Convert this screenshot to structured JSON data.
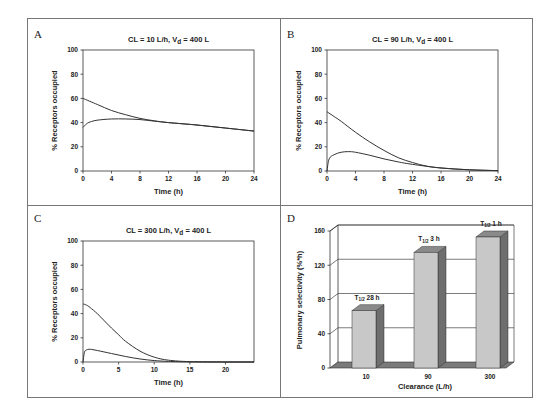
{
  "figure": {
    "panels": [
      "A",
      "B",
      "C",
      "D"
    ]
  },
  "chart_data": [
    {
      "panel": "A",
      "type": "line",
      "title": "CL = 10 L/h, Vd = 400 L",
      "title_parts": {
        "pre": "CL = 10 L/h, V",
        "sub": "d",
        "post": " = 400 L"
      },
      "xlabel": "Time (h)",
      "ylabel": "% Receptors occupied",
      "xlim": [
        0,
        24
      ],
      "ylim": [
        0,
        100
      ],
      "xticks": [
        "0",
        "4",
        "8",
        "12",
        "16",
        "20",
        "24"
      ],
      "yticks": [
        "0",
        "20",
        "40",
        "60",
        "80",
        "100"
      ],
      "grid": false,
      "series": [
        {
          "name": "upper",
          "x": [
            0,
            2,
            4,
            6,
            8,
            10,
            12,
            16,
            20,
            24
          ],
          "y": [
            60,
            55,
            50,
            46.5,
            43.5,
            41.5,
            40,
            38,
            35.5,
            33
          ]
        },
        {
          "name": "lower",
          "x": [
            0,
            0.5,
            1,
            2,
            4,
            6,
            8,
            10,
            12,
            16,
            20,
            24
          ],
          "y": [
            36,
            39,
            40.5,
            42,
            43,
            43,
            42.5,
            41.2,
            40,
            38,
            35.5,
            33
          ]
        }
      ]
    },
    {
      "panel": "B",
      "type": "line",
      "title": "CL = 90 L/h, Vd = 400 L",
      "title_parts": {
        "pre": "CL = 90 L/h, V",
        "sub": "d",
        "post": " = 400 L"
      },
      "xlabel": "Time (h)",
      "ylabel": "% Receptors occupied",
      "xlim": [
        0,
        24
      ],
      "ylim": [
        0,
        100
      ],
      "xticks": [
        "0",
        "4",
        "8",
        "12",
        "16",
        "20",
        "24"
      ],
      "yticks": [
        "0",
        "20",
        "40",
        "60",
        "80",
        "100"
      ],
      "grid": false,
      "series": [
        {
          "name": "upper",
          "x": [
            0,
            1,
            2,
            4,
            6,
            8,
            10,
            12,
            14,
            16,
            20,
            24
          ],
          "y": [
            49,
            45,
            41,
            32,
            24,
            17,
            11,
            7,
            4,
            2.5,
            1,
            0.3
          ]
        },
        {
          "name": "lower",
          "x": [
            0,
            0.3,
            1,
            2,
            3,
            4,
            6,
            8,
            10,
            12,
            16,
            20,
            24
          ],
          "y": [
            0,
            10,
            13.5,
            15.5,
            16,
            15.5,
            13,
            10,
            7.5,
            5.5,
            2.5,
            1,
            0.3
          ]
        }
      ]
    },
    {
      "panel": "C",
      "type": "line",
      "title": "CL = 300 L/h, Vd = 400 L",
      "title_parts": {
        "pre": "CL = 300 L/h, V",
        "sub": "d",
        "post": " = 400 L"
      },
      "xlabel": "Time (h)",
      "ylabel": "% Receptors occupied",
      "xlim": [
        0,
        24
      ],
      "ylim": [
        0,
        100
      ],
      "xticks": [
        "0",
        "5",
        "10",
        "15",
        "20"
      ],
      "xtick_values": [
        0,
        5,
        10,
        15,
        20
      ],
      "yticks": [
        "0",
        "20",
        "40",
        "60",
        "80",
        "100"
      ],
      "grid": false,
      "series": [
        {
          "name": "upper",
          "x": [
            0,
            0.5,
            1,
            2,
            3,
            4,
            5,
            6,
            8,
            10,
            12,
            15,
            20,
            24
          ],
          "y": [
            48,
            47,
            45,
            40,
            34,
            28,
            22.5,
            17,
            9,
            4,
            1.5,
            0.3,
            0,
            0
          ]
        },
        {
          "name": "lower",
          "x": [
            0,
            0.2,
            0.5,
            1,
            2,
            4,
            6,
            8,
            10,
            12,
            15,
            20,
            24
          ],
          "y": [
            0,
            8,
            10,
            10.5,
            9.5,
            7,
            4.5,
            2.5,
            1.2,
            0.5,
            0.1,
            0,
            0
          ]
        }
      ]
    },
    {
      "panel": "D",
      "type": "bar",
      "style": "3d",
      "title": "",
      "xlabel": "Clearance (L/h)",
      "ylabel": "Pulmonary selectivity (%*h)",
      "ylim": [
        0,
        160
      ],
      "yticks": [
        "0",
        "40",
        "80",
        "120",
        "160"
      ],
      "grid": true,
      "categories": [
        "10",
        "90",
        "300"
      ],
      "values": [
        67,
        135,
        153
      ],
      "annotations": [
        {
          "pre": "T",
          "sub": "1/2",
          "post": " 28 h"
        },
        {
          "pre": "T",
          "sub": "1/2",
          "post": " 3 h"
        },
        {
          "pre": "T",
          "sub": "1/2",
          "post": " 1 h"
        }
      ],
      "colors": {
        "bar_front": "#c8c8c8",
        "bar_side": "#6e6e6e",
        "bar_top": "#8a8a8a",
        "floor": "#7a7a7a"
      }
    }
  ]
}
